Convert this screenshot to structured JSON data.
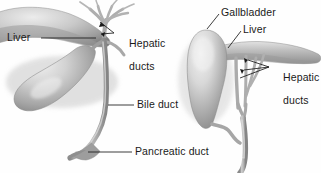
{
  "figure": {
    "background_color": "#fefefe",
    "ink_color": "#1a1a1a",
    "tissue_light": "#e8e8e8",
    "tissue_mid": "#b8b8b8",
    "tissue_dark": "#8a8a8a",
    "tissue_shadow": "#6f6f6f",
    "duct_color": "#9a9a9a",
    "width": 321,
    "height": 173
  },
  "labels": {
    "liver_left": "Liver",
    "hepatic_ducts_left_line1": "Hepatic",
    "hepatic_ducts_left_line2": "ducts",
    "bile_duct": "Bile duct",
    "pancreatic_duct": "Pancreatic duct",
    "gallbladder": "Gallbladder",
    "liver_right": "Liver",
    "hepatic_ducts_right_line1": "Hepatic",
    "hepatic_ducts_right_line2": "ducts"
  },
  "panels": [
    {
      "id": "left-panel",
      "name": "anterior-view",
      "structures": [
        "liver",
        "gallbladder",
        "hepatic-ducts",
        "bile-duct",
        "pancreatic-duct"
      ],
      "callouts": [
        "liver_left",
        "hepatic_ducts_left",
        "bile_duct",
        "pancreatic_duct"
      ]
    },
    {
      "id": "right-panel",
      "name": "lateral-view",
      "structures": [
        "gallbladder",
        "liver",
        "hepatic-ducts",
        "bile-duct"
      ],
      "callouts": [
        "gallbladder",
        "liver_right",
        "hepatic_ducts_right"
      ]
    }
  ]
}
